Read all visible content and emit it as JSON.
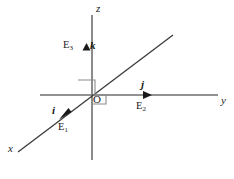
{
  "figure": {
    "background_color": "#ffffff",
    "axis_color": "#6e6e6e",
    "diagonal_color": "#3a3a3a",
    "label_color": "#1a1a1a",
    "angle_mark_color": "#8a8a8a"
  },
  "axes": {
    "z": {
      "label": "z",
      "name": "z-axis",
      "orientation": "vertical"
    },
    "y": {
      "label": "y",
      "name": "y-axis",
      "orientation": "horizontal"
    },
    "x": {
      "label": "x",
      "name": "x-axis",
      "orientation": "diagonal"
    }
  },
  "origin": {
    "label": "O"
  },
  "vectors": [
    {
      "symbol": "i",
      "basis_label": "E",
      "basis_index": "1",
      "axis": "x",
      "direction": "down-left"
    },
    {
      "symbol": "j",
      "basis_label": "E",
      "basis_index": "2",
      "axis": "y",
      "direction": "right"
    },
    {
      "symbol": "k",
      "basis_label": "E",
      "basis_index": "3",
      "axis": "z",
      "direction": "up"
    }
  ],
  "angle_marks": {
    "count": "2",
    "description": "right angle"
  }
}
